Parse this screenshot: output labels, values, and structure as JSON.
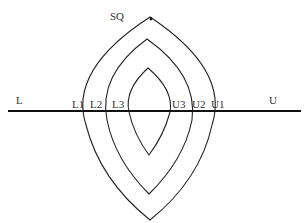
{
  "diagram": {
    "type": "nested-lens-diagram",
    "top_label": "SQ",
    "axis": {
      "left_label": "L",
      "right_label": "U"
    },
    "left_crossings": [
      "L1",
      "L2",
      "L3"
    ],
    "right_crossings": [
      "U3",
      "U2",
      "U1"
    ],
    "lenses": [
      {
        "name": "outer",
        "left_label": "L1",
        "right_label": "U1"
      },
      {
        "name": "middle",
        "left_label": "L2",
        "right_label": "U2"
      },
      {
        "name": "inner",
        "left_label": "L3",
        "right_label": "U3"
      }
    ],
    "colors": {
      "line": "#111111",
      "text": "#333333",
      "background": "#ffffff"
    }
  }
}
